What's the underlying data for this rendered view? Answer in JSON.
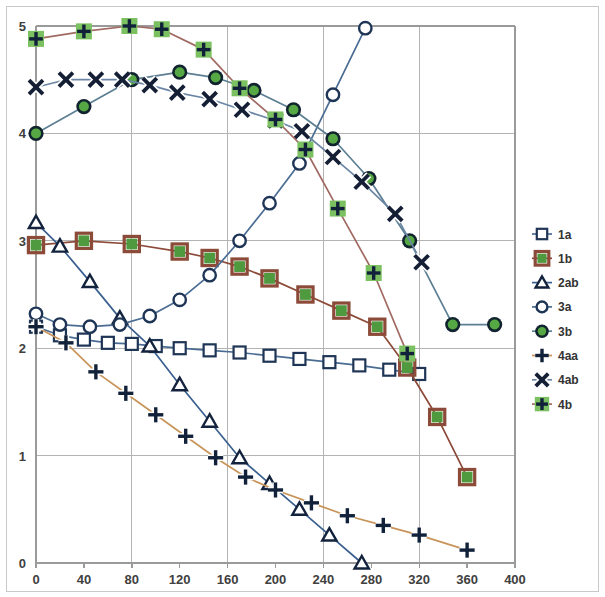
{
  "chart_data": {
    "type": "line",
    "title": "",
    "xlabel": "",
    "ylabel": "",
    "xlim": [
      0,
      400
    ],
    "ylim": [
      0,
      5
    ],
    "grid": true,
    "x_ticks": [
      0,
      40,
      80,
      120,
      160,
      200,
      240,
      280,
      320,
      360,
      400
    ],
    "x_tick_labels": [
      "0",
      "40",
      "80",
      "120",
      "160",
      "200",
      "240",
      "280",
      "320",
      "360",
      "400"
    ],
    "y_ticks": [
      0,
      1,
      2,
      3,
      4,
      5
    ],
    "y_tick_labels": [
      "0",
      "1",
      "2",
      "3",
      "4",
      "5"
    ],
    "x_gridlines": [
      0,
      80,
      160,
      240,
      320,
      400
    ],
    "y_gridlines": [
      0,
      1,
      2,
      3,
      4,
      5
    ],
    "legend_position": "right",
    "series": [
      {
        "name": "1a",
        "marker": "open-square",
        "line_color": "#4a6c93",
        "marker_edge_color": "#1f3556",
        "marker_fill_color": "#ffffff",
        "x": [
          0,
          20,
          40,
          60,
          80,
          100,
          120,
          145,
          170,
          195,
          220,
          245,
          270,
          295,
          320
        ],
        "y": [
          2.2,
          2.12,
          2.08,
          2.05,
          2.04,
          2.02,
          2.0,
          1.98,
          1.96,
          1.93,
          1.9,
          1.87,
          1.84,
          1.8,
          1.76
        ]
      },
      {
        "name": "1b",
        "marker": "filled-square",
        "line_color": "#8c4a38",
        "marker_edge_color": "#8c4a38",
        "marker_fill_color": "#4f9a3f",
        "x": [
          0,
          40,
          80,
          120,
          145,
          170,
          195,
          225,
          255,
          285,
          310,
          335,
          360
        ],
        "y": [
          2.96,
          3.0,
          2.97,
          2.9,
          2.84,
          2.76,
          2.65,
          2.5,
          2.35,
          2.2,
          1.82,
          1.36,
          0.8
        ]
      },
      {
        "name": "2ab",
        "marker": "open-triangle",
        "line_color": "#3a5f8f",
        "marker_edge_color": "#14233d",
        "marker_fill_color": "#ffffff",
        "x": [
          0,
          20,
          45,
          70,
          95,
          120,
          145,
          170,
          195,
          220,
          245,
          272
        ],
        "y": [
          3.17,
          2.95,
          2.62,
          2.28,
          2.02,
          1.66,
          1.32,
          0.98,
          0.74,
          0.5,
          0.26,
          0.0
        ]
      },
      {
        "name": "3a",
        "marker": "open-circle",
        "line_color": "#4a6c93",
        "marker_edge_color": "#1f3556",
        "marker_fill_color": "#ffffff",
        "x": [
          0,
          20,
          45,
          70,
          95,
          120,
          145,
          170,
          195,
          220,
          248,
          275
        ],
        "y": [
          2.32,
          2.22,
          2.2,
          2.22,
          2.3,
          2.45,
          2.68,
          3.0,
          3.35,
          3.72,
          4.36,
          4.98
        ]
      },
      {
        "name": "3b",
        "marker": "filled-circle",
        "line_color": "#5c7f93",
        "marker_edge_color": "#11232e",
        "marker_fill_color": "#55a844",
        "x": [
          0,
          40,
          80,
          120,
          150,
          182,
          215,
          248,
          278,
          312,
          348,
          383
        ],
        "y": [
          4.0,
          4.25,
          4.5,
          4.57,
          4.52,
          4.4,
          4.22,
          3.95,
          3.58,
          3.0,
          2.22,
          2.22
        ]
      },
      {
        "name": "4aa",
        "marker": "plus",
        "line_color": "#c8945a",
        "marker_edge_color": "#11213a",
        "marker_fill_color": "#11213a",
        "x": [
          0,
          25,
          50,
          75,
          100,
          125,
          150,
          175,
          200,
          230,
          260,
          290,
          320,
          360
        ],
        "y": [
          2.2,
          2.05,
          1.78,
          1.58,
          1.38,
          1.18,
          0.98,
          0.8,
          0.68,
          0.56,
          0.44,
          0.35,
          0.26,
          0.12
        ]
      },
      {
        "name": "4ab",
        "marker": "x",
        "line_color": "#6b86a5",
        "marker_edge_color": "#141f35",
        "marker_fill_color": "#141f35",
        "x": [
          0,
          25,
          50,
          72,
          95,
          118,
          145,
          172,
          200,
          222,
          248,
          272,
          300,
          322
        ],
        "y": [
          4.43,
          4.5,
          4.5,
          4.5,
          4.45,
          4.38,
          4.32,
          4.22,
          4.12,
          4.02,
          3.78,
          3.55,
          3.25,
          2.8
        ]
      },
      {
        "name": "4b",
        "marker": "plus-in-square",
        "line_color": "#a06a62",
        "marker_edge_color": "#11213a",
        "marker_fill_color": "#7cc161",
        "x": [
          0,
          40,
          78,
          105,
          140,
          170,
          200,
          225,
          252,
          282,
          310
        ],
        "y": [
          4.88,
          4.95,
          5.0,
          4.97,
          4.78,
          4.42,
          4.13,
          3.85,
          3.3,
          2.7,
          1.95
        ]
      }
    ]
  },
  "legend": {
    "entries": [
      {
        "label": "1a"
      },
      {
        "label": "1b"
      },
      {
        "label": "2ab"
      },
      {
        "label": "3a"
      },
      {
        "label": "3b"
      },
      {
        "label": "4aa"
      },
      {
        "label": "4ab"
      },
      {
        "label": "4b"
      }
    ]
  },
  "colors": {
    "grid": "#b3b3b3",
    "axis": "#9a9a9a",
    "background": "#ffffff",
    "blue_line": "#4a6c93",
    "brown_line": "#8c4a38",
    "orange_line": "#c8945a",
    "green_fill": "#4f9a3f",
    "light_green_fill": "#7cc161",
    "dark_navy": "#14233d"
  }
}
